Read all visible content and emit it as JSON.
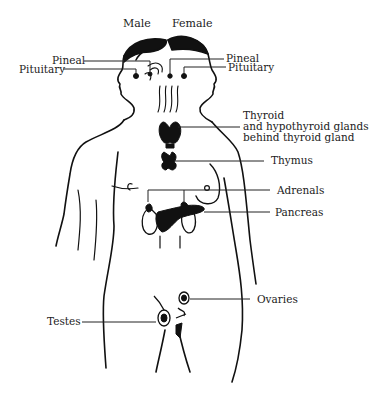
{
  "diagram": {
    "headers": {
      "male": "Male",
      "female": "Female"
    },
    "labels": {
      "pineal_left": "Pineal",
      "pituitary_left": "Pituitary",
      "pineal_right": "Pineal",
      "pituitary_right": "Pituitary",
      "thyroid_line1": "Thyroid",
      "thyroid_line2": "and hypothyroid glands",
      "thyroid_line3": "behind thyroid gland",
      "thymus": "Thymus",
      "adrenals": "Adrenals",
      "pancreas": "Pancreas",
      "ovaries": "Ovaries",
      "testes": "Testes"
    },
    "colors": {
      "ink": "#111111",
      "background": "#ffffff",
      "text": "#222222"
    }
  }
}
